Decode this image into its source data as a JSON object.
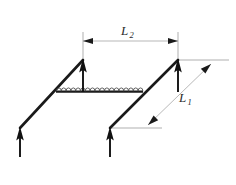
{
  "figure": {
    "type": "engineering-diagram",
    "background_color": "#ffffff",
    "line_color": "#1a1a1a",
    "dimension_color": "#9a9a9a",
    "labels": {
      "length_1": {
        "symbol": "L",
        "subscript": "1"
      },
      "length_2": {
        "symbol": "L",
        "subscript": "2"
      }
    },
    "force_arrows": [
      {
        "name": "force-arrow-bottom-left",
        "x": 20,
        "tip_y": 127,
        "tail_y": 157
      },
      {
        "name": "force-arrow-top-left",
        "x": 83,
        "tip_y": 59,
        "tail_y": 92
      },
      {
        "name": "force-arrow-bottom-middle",
        "x": 110,
        "tip_y": 127,
        "tail_y": 157
      },
      {
        "name": "force-arrow-top-right",
        "x": 178,
        "tip_y": 59,
        "tail_y": 92
      }
    ],
    "frame_segments": [
      {
        "name": "left-diagonal-member",
        "x1": 20,
        "y1": 128,
        "x2": 83,
        "y2": 60
      },
      {
        "name": "right-diagonal-member",
        "x1": 110,
        "y1": 128,
        "x2": 178,
        "y2": 60
      }
    ],
    "coil": {
      "name": "coil-element",
      "x_start": 56,
      "x_end": 143,
      "y": 91,
      "loop_count": 17
    },
    "dimension_l2": {
      "x_start": 83,
      "x_end": 178,
      "y": 41,
      "orientation": "horizontal"
    },
    "dimension_l1": {
      "x_start": 148,
      "y_start": 125,
      "x_end": 211,
      "y_end": 64,
      "orientation": "diagonal"
    }
  }
}
